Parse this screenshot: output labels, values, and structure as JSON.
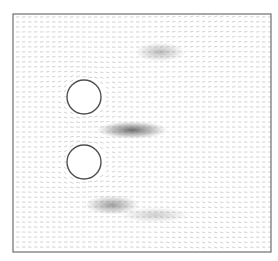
{
  "figure": {
    "type": "flow-field-vector-plot",
    "frame": {
      "x": 13,
      "y": 14,
      "width": 258,
      "height": 238,
      "stroke": "#6e6e6e"
    },
    "background": "#ffffff",
    "arrow_color": "#8a8a8a",
    "arrow_spacing": 5,
    "cylinders": [
      {
        "name": "upper-cylinder",
        "cx": 84,
        "cy": 97,
        "r": 17,
        "stroke": "#505050",
        "fill": "#ffffff"
      },
      {
        "name": "lower-cylinder",
        "cx": 84,
        "cy": 162,
        "r": 17,
        "stroke": "#505050",
        "fill": "#ffffff"
      }
    ],
    "dark_regions": [
      {
        "name": "center-wake",
        "cx": 132,
        "cy": 130,
        "rx": 36,
        "ry": 9,
        "opacity": 0.75
      },
      {
        "name": "upper-shear-layer",
        "cx": 160,
        "cy": 52,
        "rx": 26,
        "ry": 10,
        "opacity": 0.35
      },
      {
        "name": "lower-shear-layer",
        "cx": 112,
        "cy": 205,
        "rx": 28,
        "ry": 10,
        "opacity": 0.5
      },
      {
        "name": "lower-right-band",
        "cx": 155,
        "cy": 215,
        "rx": 35,
        "ry": 8,
        "opacity": 0.25
      }
    ]
  }
}
